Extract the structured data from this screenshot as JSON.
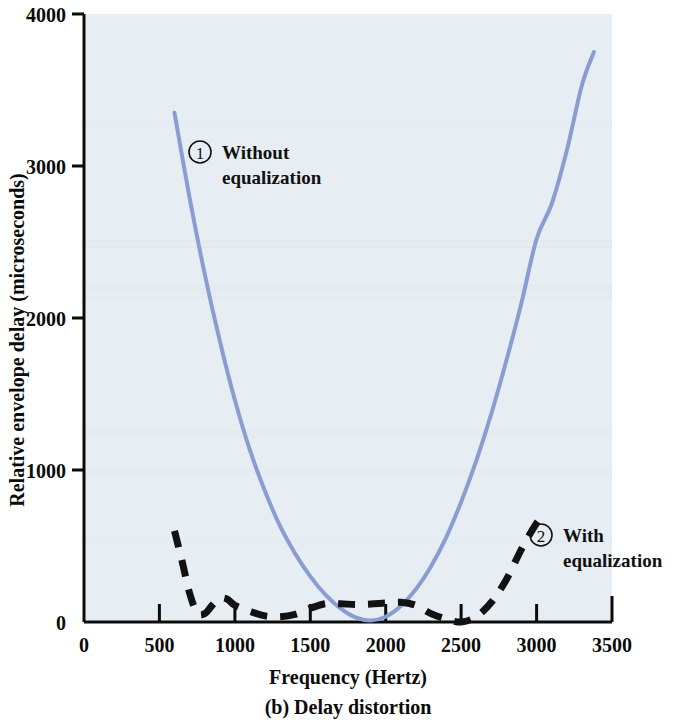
{
  "figure": {
    "caption": "(b) Delay distortion",
    "background_color": "#ffffff",
    "plot_background_color": "#e6eef3"
  },
  "chart_data": {
    "type": "line",
    "title": "",
    "subtitle": "",
    "caption": "(b) Delay distortion",
    "xlabel": "Frequency (Hertz)",
    "ylabel": "Relative envelope delay (microseconds)",
    "xlim": [
      0,
      3500
    ],
    "ylim": [
      0,
      4000
    ],
    "xticks": [
      0,
      500,
      1000,
      1500,
      2000,
      2500,
      3000,
      3500
    ],
    "xtick_labels": [
      "0",
      "500",
      "1000",
      "1500",
      "2000",
      "2500",
      "3000",
      "3500"
    ],
    "yticks": [
      0,
      1000,
      2000,
      3000,
      4000
    ],
    "ytick_labels": [
      "0",
      "1000",
      "2000",
      "3000",
      "4000"
    ],
    "grid": false,
    "legend_position": "inline-annotations",
    "series": [
      {
        "name": "Without equalization",
        "marker_number": "1",
        "style": "solid",
        "color": "#8a9dd3",
        "width": 4,
        "x": [
          600,
          700,
          800,
          900,
          1000,
          1100,
          1200,
          1300,
          1400,
          1500,
          1600,
          1700,
          1800,
          1900,
          2000,
          2100,
          2200,
          2300,
          2400,
          2500,
          2600,
          2700,
          2800,
          2900,
          3000,
          3100,
          3200,
          3300,
          3380
        ],
        "y": [
          3350,
          2790,
          2290,
          1850,
          1460,
          1130,
          860,
          630,
          450,
          300,
          180,
          90,
          30,
          10,
          35,
          105,
          215,
          365,
          555,
          790,
          1060,
          1370,
          1720,
          2100,
          2520,
          2750,
          3100,
          3530,
          3750
        ]
      },
      {
        "name": "With equalization",
        "marker_number": "2",
        "style": "dashed",
        "color": "#121212",
        "width": 7,
        "x": [
          600,
          650,
          700,
          750,
          800,
          850,
          900,
          950,
          1000,
          1100,
          1200,
          1300,
          1400,
          1500,
          1600,
          1700,
          1800,
          1900,
          2000,
          2100,
          2200,
          2300,
          2400,
          2500,
          2600,
          2700,
          2800,
          2900,
          3000,
          3050
        ],
        "y": [
          600,
          400,
          190,
          60,
          55,
          110,
          155,
          150,
          110,
          70,
          40,
          35,
          50,
          90,
          120,
          120,
          115,
          118,
          125,
          130,
          110,
          55,
          20,
          0,
          35,
          130,
          280,
          480,
          650,
          700
        ]
      }
    ],
    "annotations": [
      {
        "id": "annot-without-equalization",
        "number": "1",
        "line1": "Without",
        "line2": "equalization",
        "x_px": 190,
        "y_px": 145
      },
      {
        "id": "annot-with-equalization",
        "number": "2",
        "line1": "With",
        "line2": "equalization",
        "x_px": 532,
        "y_px": 527
      }
    ]
  }
}
